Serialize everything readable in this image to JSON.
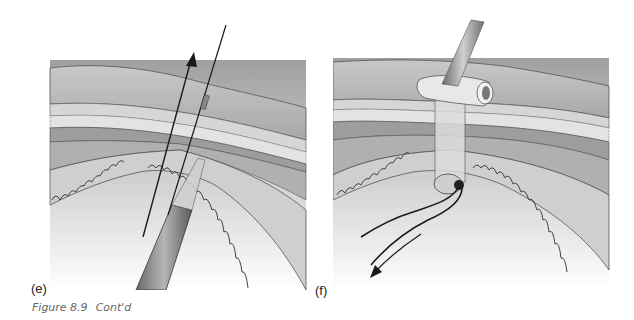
{
  "figure": {
    "caption_label": "Figure 8.9",
    "caption_text": "Cont'd",
    "panels": [
      {
        "id": "e",
        "label": "(e)",
        "description": "Needle with guidewire passing through abdominal wall layers into peritoneal cavity; arrow pointing upward indicates withdrawal direction"
      },
      {
        "id": "f",
        "label": "(f)",
        "description": "Drain tube secured with flange through abdominal wall layers; suture threads exit into cavity with arrow pointing downward-left"
      }
    ]
  },
  "colors": {
    "skin_fill": "#b8b8b8",
    "fat_fill": "#d4d4d4",
    "muscle_fill": "#9a9a9a",
    "cavity_top": "#a8a8a8",
    "cavity_bottom": "#f4f4f4",
    "line": "#2a2a2a",
    "caption": "#666666"
  }
}
